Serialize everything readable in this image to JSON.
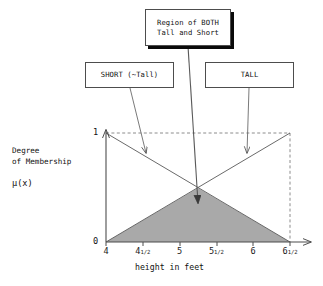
{
  "figure": {
    "callouts": {
      "region": {
        "label": "Region of BOTH\nTall and Short",
        "name": "region-of-both-callout"
      },
      "short": {
        "label": "SHORT (~Tall)",
        "name": "short-callout"
      },
      "tall": {
        "label": "TALL",
        "name": "tall-callout"
      }
    },
    "axis": {
      "ylabel_line": "Degree\nof Membership",
      "ylabel_symbol": "μ(x)",
      "xlabel": "height in feet",
      "ytick_top": "1",
      "ytick_bottom": "0"
    },
    "colors": {
      "line": "#4d4d4d",
      "shade": "#a9a9a9",
      "text": "#111111",
      "shadow": "#0a0a0a",
      "dashed": "#777777"
    }
  },
  "chart_data": {
    "type": "line",
    "title": "",
    "subtitle": "",
    "xlabel": "height in feet",
    "ylabel": "Degree of Membership μ(x)",
    "xlim": [
      4,
      6.5
    ],
    "ylim": [
      0,
      1
    ],
    "grid": false,
    "legend_position": "callout-boxes",
    "xticks": [
      4,
      4.5,
      5,
      5.5,
      6,
      6.5
    ],
    "xticklabels": [
      "4",
      "4 1/2",
      "5",
      "5 1/2",
      "6",
      "6 1/2"
    ],
    "yticks": [
      0,
      1
    ],
    "yticklabels": [
      "0",
      "1"
    ],
    "series": [
      {
        "name": "SHORT (~Tall)",
        "x": [
          4,
          6.5
        ],
        "values": [
          1,
          0
        ]
      },
      {
        "name": "TALL",
        "x": [
          4,
          6.5
        ],
        "values": [
          0,
          1
        ]
      }
    ],
    "shaded_region": {
      "name": "Region of BOTH Tall and Short",
      "description": "minimum of SHORT and TALL membership (fuzzy AND)",
      "x": [
        4,
        5.25,
        6.5
      ],
      "values": [
        0,
        0.5,
        0
      ],
      "color": "#a9a9a9"
    },
    "annotations": [
      {
        "text": "Region of BOTH Tall and Short",
        "x": 5.25,
        "y": 0.25
      },
      {
        "text": "SHORT (~Tall)",
        "x": 4.55,
        "y": 0.8
      },
      {
        "text": "TALL",
        "x": 5.9,
        "y": 0.8
      }
    ],
    "intersection": {
      "x": 5.25,
      "y": 0.5
    }
  }
}
